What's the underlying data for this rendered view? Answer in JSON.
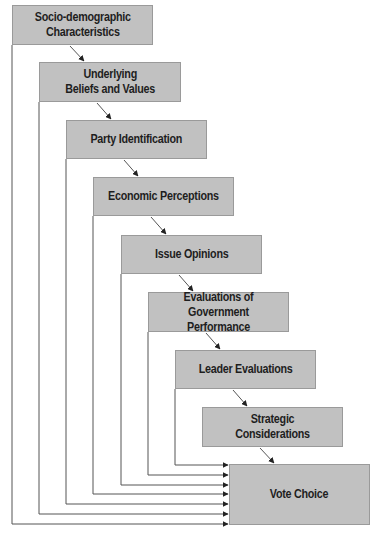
{
  "diagram": {
    "colors": {
      "box_fill": "#c1c1c1",
      "box_border": "#9a9a9a",
      "text": "#1e1e1e",
      "line": "#555555",
      "background": "#ffffff"
    },
    "nodes": [
      {
        "id": "socio",
        "label": "Socio-demographic\nCharacteristics",
        "x": 12,
        "y": 5,
        "w": 141,
        "h": 40
      },
      {
        "id": "beliefs",
        "label": "Underlying\nBeliefs and Values",
        "x": 39,
        "y": 62,
        "w": 142,
        "h": 40
      },
      {
        "id": "party",
        "label": "Party Identification",
        "x": 66,
        "y": 120,
        "w": 141,
        "h": 39
      },
      {
        "id": "economic",
        "label": "Economic Perceptions",
        "x": 93,
        "y": 177,
        "w": 141,
        "h": 39
      },
      {
        "id": "issues",
        "label": "Issue Opinions",
        "x": 121,
        "y": 235,
        "w": 141,
        "h": 39
      },
      {
        "id": "government",
        "label": "Evaluations of Government\nPerformance",
        "x": 148,
        "y": 292,
        "w": 141,
        "h": 40
      },
      {
        "id": "leaders",
        "label": "Leader Evaluations",
        "x": 175,
        "y": 350,
        "w": 141,
        "h": 39
      },
      {
        "id": "strategic",
        "label": "Strategic Considerations",
        "x": 202,
        "y": 407,
        "w": 141,
        "h": 40
      },
      {
        "id": "vote",
        "label": "Vote Choice",
        "x": 229,
        "y": 464,
        "w": 141,
        "h": 61
      }
    ],
    "edges": [
      {
        "from": "socio",
        "to": "beliefs",
        "type": "diagonal"
      },
      {
        "from": "beliefs",
        "to": "party",
        "type": "diagonal"
      },
      {
        "from": "party",
        "to": "economic",
        "type": "diagonal"
      },
      {
        "from": "economic",
        "to": "issues",
        "type": "diagonal"
      },
      {
        "from": "issues",
        "to": "government",
        "type": "diagonal"
      },
      {
        "from": "government",
        "to": "leaders",
        "type": "diagonal"
      },
      {
        "from": "leaders",
        "to": "strategic",
        "type": "diagonal"
      },
      {
        "from": "strategic",
        "to": "vote",
        "type": "diagonal"
      },
      {
        "from": "leaders",
        "to": "vote",
        "type": "elbow",
        "x": 175,
        "y": 465
      },
      {
        "from": "government",
        "to": "vote",
        "type": "elbow",
        "x": 148,
        "y": 475
      },
      {
        "from": "issues",
        "to": "vote",
        "type": "elbow",
        "x": 121,
        "y": 485
      },
      {
        "from": "economic",
        "to": "vote",
        "type": "elbow",
        "x": 93,
        "y": 494
      },
      {
        "from": "party",
        "to": "vote",
        "type": "elbow",
        "x": 66,
        "y": 504
      },
      {
        "from": "beliefs",
        "to": "vote",
        "type": "elbow",
        "x": 39,
        "y": 514
      },
      {
        "from": "socio",
        "to": "vote",
        "type": "elbow",
        "x": 12,
        "y": 524
      }
    ]
  }
}
